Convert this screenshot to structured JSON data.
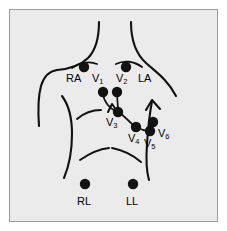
{
  "figure": {
    "name": "ecg-electrode-placement-diagram",
    "background_color": "#ebebeb",
    "page_color": "#ffffff",
    "border_color": "#9d9d9d",
    "ink_color": "#000000",
    "electrode_color": "#121212"
  },
  "electrodes": [
    {
      "id": "RA",
      "label": "RA",
      "sub": "",
      "cx": 84,
      "cy": 67,
      "r": 5.2
    },
    {
      "id": "V2",
      "label": "V",
      "sub": "2",
      "cx": 126,
      "cy": 67,
      "r": 5.2
    },
    {
      "id": "V1",
      "label": "V",
      "sub": "1",
      "cx": 103,
      "cy": 92,
      "r": 5.2
    },
    {
      "id": "V2b",
      "label": "",
      "sub": "",
      "cx": 117,
      "cy": 92,
      "r": 5.2
    },
    {
      "id": "V3",
      "label": "V",
      "sub": "3",
      "cx": 118,
      "cy": 112,
      "r": 5.2
    },
    {
      "id": "V4",
      "label": "V",
      "sub": "4",
      "cx": 136,
      "cy": 127,
      "r": 5.2
    },
    {
      "id": "V6",
      "label": "V",
      "sub": "6",
      "cx": 153,
      "cy": 122,
      "r": 5.2
    },
    {
      "id": "V5",
      "label": "V",
      "sub": "5",
      "cx": 150,
      "cy": 131,
      "r": 5.2
    },
    {
      "id": "RL",
      "label": "RL",
      "sub": "",
      "cx": 85,
      "cy": 184,
      "r": 5.2
    },
    {
      "id": "LL",
      "label": "LL",
      "sub": "",
      "cx": 133,
      "cy": 184,
      "r": 5.2
    }
  ],
  "labels": {
    "ra": {
      "text": "RA",
      "sub": "",
      "x": 66,
      "y": 73
    },
    "v1": {
      "text": "V",
      "sub": "1",
      "x": 92,
      "y": 73
    },
    "v2": {
      "text": "V",
      "sub": "2",
      "x": 117,
      "y": 73
    },
    "la": {
      "text": "LA",
      "sub": "",
      "x": 139,
      "y": 73
    },
    "v3": {
      "text": "V",
      "sub": "3",
      "x": 107,
      "y": 120
    },
    "v4": {
      "text": "V",
      "sub": "4",
      "x": 129,
      "y": 135
    },
    "v5": {
      "text": "V",
      "sub": "5",
      "x": 145,
      "y": 140
    },
    "v6": {
      "text": "V",
      "sub": "6",
      "x": 159,
      "y": 131
    },
    "rl": {
      "text": "RL",
      "sub": "",
      "x": 78,
      "y": 200
    },
    "ll": {
      "text": "LL",
      "sub": "",
      "x": 127,
      "y": 200
    }
  },
  "anatomy": {
    "neck_left": "neck-left-contour",
    "neck_right": "neck-right-contour",
    "shoulder_left": "left-shoulder-contour",
    "shoulder_right": "right-shoulder-contour",
    "arm_left": "left-arm-inner-contour",
    "arm_right": "right-arm-inner-contour",
    "breast_left": "left-breast-arc",
    "breast_right": "right-breast-arc",
    "ribcage_left": "left-costal-margin",
    "ribcage_right": "right-costal-margin",
    "sternum_notch": "sternal-notch-v",
    "lead_wire_v1_v3": "lead-wire-v1-to-v3",
    "lead_wire_v2_v3": "lead-wire-v2-to-v3",
    "lead_wire_v3_v4": "lead-wire-v3-to-v4",
    "lead_wire_v4_v5": "lead-wire-v4-to-v5"
  }
}
